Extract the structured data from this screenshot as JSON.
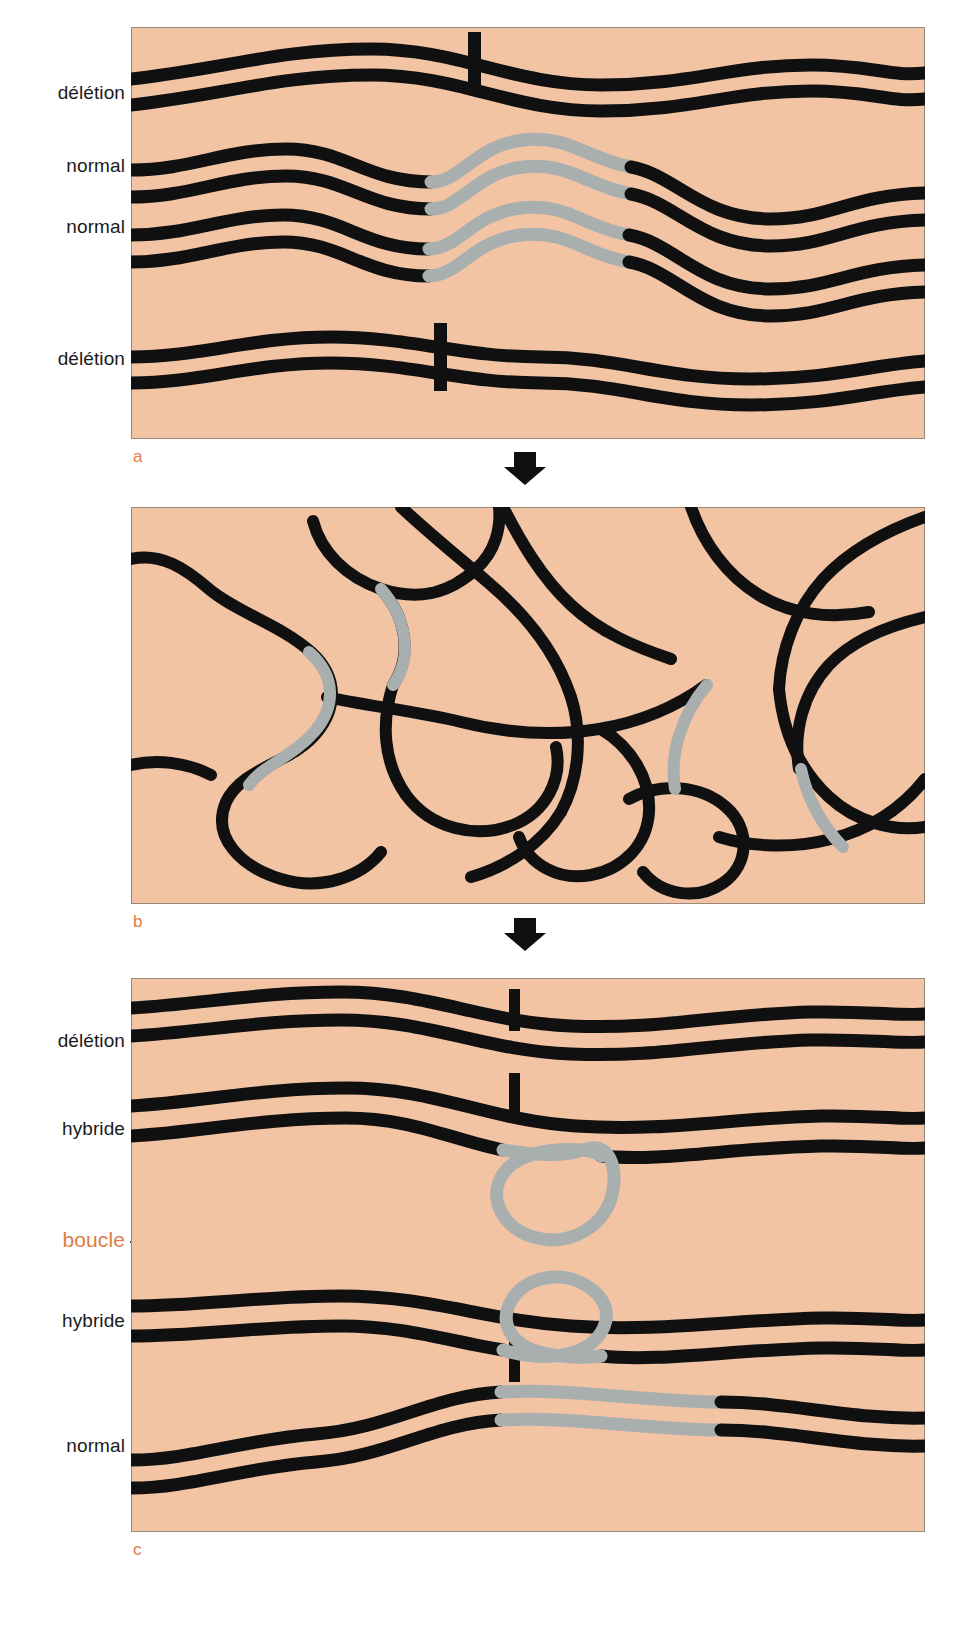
{
  "figure": {
    "background_color": "#F2C4A4",
    "strand_color": "#101010",
    "hybrid_segment_color": "#A9AFAF",
    "accent_color": "#E07C44",
    "page_background": "#FFFFFF"
  },
  "panels": [
    {
      "letter": "a",
      "caption": "Double-stranded DNA molecules before denaturation",
      "labels": [
        {
          "text": "délétion",
          "meaning": "deletion-strand"
        },
        {
          "text": "normal",
          "meaning": "normal-strand"
        },
        {
          "text": "normal",
          "meaning": "normal-strand"
        },
        {
          "text": "délétion",
          "meaning": "deletion-strand"
        }
      ]
    },
    {
      "letter": "b",
      "caption": "Denatured single strands, tangled",
      "labels": []
    },
    {
      "letter": "c",
      "caption": "Re-annealed duplexes, heteroduplexes show loops",
      "labels": [
        {
          "text": "délétion",
          "meaning": "deletion-duplex"
        },
        {
          "text": "hybride",
          "meaning": "heteroduplex"
        },
        {
          "text": "boucle",
          "meaning": "loop",
          "accent": true
        },
        {
          "text": "hybride",
          "meaning": "heteroduplex"
        },
        {
          "text": "normal",
          "meaning": "normal-duplex"
        }
      ]
    }
  ],
  "arrows": [
    {
      "name": "arrow-a-to-b",
      "direction": "down"
    },
    {
      "name": "arrow-b-to-c",
      "direction": "down"
    }
  ],
  "annotations": {
    "loop_callout_label": "boucle",
    "loop_callout_targets": 2
  }
}
